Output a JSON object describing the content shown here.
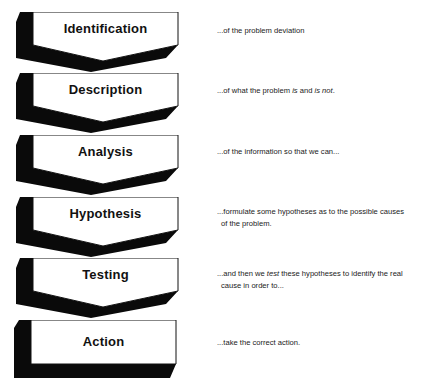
{
  "colors": {
    "face": "#ffffff",
    "shadow": "#0a0a0a",
    "outline": "#111111",
    "text": "#1a1a1a"
  },
  "steps": [
    {
      "label": "Identification",
      "top": 12,
      "shape": "chevron",
      "desc": {
        "line1_a": "...of the problem deviation",
        "line1_i1": "",
        "line1_b": "",
        "line1_i2": "",
        "line1_c": "",
        "line2": ""
      },
      "desc_top": 25
    },
    {
      "label": "Description",
      "top": 73,
      "shape": "chevron",
      "desc": {
        "line1_a": "...of what the problem ",
        "line1_i1": "is",
        "line1_b": " and ",
        "line1_i2": "is not",
        "line1_c": ".",
        "line2": ""
      },
      "desc_top": 85
    },
    {
      "label": "Analysis",
      "top": 135,
      "shape": "chevron",
      "desc": {
        "line1_a": "...of the information so that we can...",
        "line1_i1": "",
        "line1_b": "",
        "line1_i2": "",
        "line1_c": "",
        "line2": ""
      },
      "desc_top": 146
    },
    {
      "label": "Hypothesis",
      "top": 197,
      "shape": "chevron",
      "desc": {
        "line1_a": "...formulate some hypotheses as to the possible causes",
        "line1_i1": "",
        "line1_b": "",
        "line1_i2": "",
        "line1_c": "",
        "line2": "of the problem."
      },
      "desc_top": 206
    },
    {
      "label": "Testing",
      "top": 258,
      "shape": "chevron",
      "desc": {
        "line1_a": "...and then we ",
        "line1_i1": "test",
        "line1_b": " these hypotheses to identify the real",
        "line1_i2": "",
        "line1_c": "",
        "line2": "cause in order to..."
      },
      "desc_top": 268
    },
    {
      "label": "Action",
      "top": 320,
      "shape": "box",
      "desc": {
        "line1_a": "...take the correct action.",
        "line1_i1": "",
        "line1_b": "",
        "line1_i2": "",
        "line1_c": "",
        "line2": ""
      },
      "desc_top": 337
    }
  ]
}
